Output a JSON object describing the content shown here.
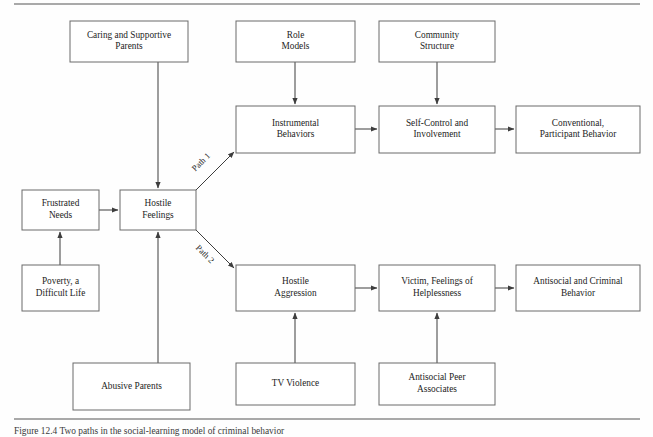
{
  "figure": {
    "caption": "Figure 12.4  Two paths in the social-learning model of criminal behavior",
    "top_rule": true,
    "bottom_rule": true
  },
  "diagram": {
    "type": "flowchart",
    "nodes": [
      {
        "id": "caring_parents",
        "label_lines": [
          "Caring and Supportive",
          "Parents"
        ],
        "x": 70,
        "y": 21,
        "w": 118,
        "h": 41
      },
      {
        "id": "role_models",
        "label_lines": [
          "Role",
          "Models"
        ],
        "x": 236,
        "y": 21,
        "w": 119,
        "h": 41
      },
      {
        "id": "community_structure",
        "label_lines": [
          "Community",
          "Structure"
        ],
        "x": 379,
        "y": 21,
        "w": 116,
        "h": 41
      },
      {
        "id": "instrumental_behaviors",
        "label_lines": [
          "Instrumental",
          "Behaviors"
        ],
        "x": 236,
        "y": 106,
        "w": 119,
        "h": 47
      },
      {
        "id": "self_control",
        "label_lines": [
          "Self-Control and",
          "Involvement"
        ],
        "x": 379,
        "y": 106,
        "w": 116,
        "h": 47
      },
      {
        "id": "conventional_behavior",
        "label_lines": [
          "Conventional,",
          "Participant Behavior"
        ],
        "x": 516,
        "y": 106,
        "w": 124,
        "h": 47
      },
      {
        "id": "frustrated_needs",
        "label_lines": [
          "Frustrated",
          "Needs"
        ],
        "x": 22,
        "y": 190,
        "w": 77,
        "h": 40
      },
      {
        "id": "hostile_feelings",
        "label_lines": [
          "Hostile",
          "Feelings"
        ],
        "x": 120,
        "y": 190,
        "w": 76,
        "h": 40
      },
      {
        "id": "poverty",
        "label_lines": [
          "Poverty, a",
          "Difficult Life"
        ],
        "x": 22,
        "y": 265,
        "w": 77,
        "h": 46
      },
      {
        "id": "hostile_aggression",
        "label_lines": [
          "Hostile",
          "Aggression"
        ],
        "x": 236,
        "y": 265,
        "w": 119,
        "h": 46
      },
      {
        "id": "victim_helplessness",
        "label_lines": [
          "Victim, Feelings of",
          "Helplessness"
        ],
        "x": 379,
        "y": 265,
        "w": 116,
        "h": 46
      },
      {
        "id": "antisocial_criminal",
        "label_lines": [
          "Antisocial and Criminal",
          "Behavior"
        ],
        "x": 516,
        "y": 265,
        "w": 124,
        "h": 46
      },
      {
        "id": "abusive_parents",
        "label_lines": [
          "Abusive Parents"
        ],
        "x": 73,
        "y": 363,
        "w": 117,
        "h": 47
      },
      {
        "id": "tv_violence",
        "label_lines": [
          "TV Violence"
        ],
        "x": 236,
        "y": 363,
        "w": 119,
        "h": 42
      },
      {
        "id": "antisocial_peers",
        "label_lines": [
          "Antisocial Peer",
          "Associates"
        ],
        "x": 379,
        "y": 363,
        "w": 116,
        "h": 42
      }
    ],
    "edges": [
      {
        "id": "caring-to-hostile",
        "from": "caring_parents",
        "to": "hostile_feelings",
        "points": "158,62 158,188",
        "arrow": true
      },
      {
        "id": "rolemodels-to-instrumental",
        "from": "role_models",
        "to": "instrumental_behaviors",
        "points": "295,62 295,104",
        "arrow": true
      },
      {
        "id": "community-to-selfcontrol",
        "from": "community_structure",
        "to": "self_control",
        "points": "437,62 437,104",
        "arrow": true
      },
      {
        "id": "instrumental-to-selfcontrol",
        "from": "instrumental_behaviors",
        "to": "self_control",
        "points": "355,129 377,129",
        "arrow": true
      },
      {
        "id": "selfcontrol-to-conventional",
        "from": "self_control",
        "to": "conventional_behavior",
        "points": "495,129 514,129",
        "arrow": true
      },
      {
        "id": "frustrated-to-hostile",
        "from": "frustrated_needs",
        "to": "hostile_feelings",
        "points": "99,210 118,210",
        "arrow": true
      },
      {
        "id": "poverty-to-frustrated",
        "from": "poverty",
        "to": "frustrated_needs",
        "points": "60,265 60,232",
        "arrow": true
      },
      {
        "id": "abusive-to-hostile",
        "from": "abusive_parents",
        "to": "hostile_feelings",
        "points": "158,363 158,232",
        "arrow": true
      },
      {
        "id": "hostile-to-instrumental",
        "from": "hostile_feelings",
        "to": "instrumental_behaviors",
        "points": "196,190 234,152",
        "arrow": true,
        "label": "Path 1",
        "label_x": 203,
        "label_y": 164,
        "label_rotate": -45
      },
      {
        "id": "hostile-to-aggression",
        "from": "hostile_feelings",
        "to": "hostile_aggression",
        "points": "196,230 234,268",
        "arrow": true,
        "label": "Path 2",
        "label_x": 203,
        "label_y": 256,
        "label_rotate": 45
      },
      {
        "id": "aggression-to-victim",
        "from": "hostile_aggression",
        "to": "victim_helplessness",
        "points": "355,288 377,288",
        "arrow": true
      },
      {
        "id": "victim-to-antisocial",
        "from": "victim_helplessness",
        "to": "antisocial_criminal",
        "points": "495,288 514,288",
        "arrow": true
      },
      {
        "id": "tv-to-aggression",
        "from": "tv_violence",
        "to": "hostile_aggression",
        "points": "295,363 295,313",
        "arrow": true
      },
      {
        "id": "peers-to-victim",
        "from": "antisocial_peers",
        "to": "victim_helplessness",
        "points": "437,363 437,313",
        "arrow": true
      }
    ],
    "colors": {
      "box_stroke": "#6a6a6a",
      "box_fill": "#ffffff",
      "connector": "#3d3d3d",
      "text": "#1d1d1d",
      "rule": "#555555"
    }
  }
}
